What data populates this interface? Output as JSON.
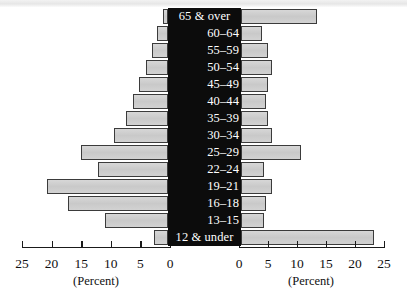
{
  "chart_data": {
    "type": "bar",
    "subtype": "population-pyramid",
    "title": "",
    "xlabel": "(Percent)",
    "ylabel": "",
    "categories": [
      "65 & over",
      "60–64",
      "55–59",
      "50–54",
      "45–49",
      "40–44",
      "35–39",
      "30–34",
      "25–29",
      "22–24",
      "19–21",
      "16–18",
      "13–15",
      "12 & under"
    ],
    "series": [
      {
        "name": "left",
        "side": "left",
        "values": [
          0.8,
          1.6,
          2.4,
          3.3,
          4.3,
          5.2,
          6.3,
          8.0,
          12.9,
          10.4,
          18.0,
          14.9,
          9.4,
          2.1
        ]
      },
      {
        "name": "right",
        "side": "right",
        "values": [
          11.4,
          3.2,
          4.0,
          4.7,
          4.1,
          3.8,
          4.0,
          4.7,
          9.1,
          3.5,
          4.6,
          3.8,
          3.4,
          20.1
        ]
      }
    ],
    "xlim": [
      0,
      25
    ],
    "left_ticks": [
      25,
      20,
      15,
      10,
      5,
      0
    ],
    "right_ticks": [
      0,
      5,
      10,
      15,
      20,
      25
    ],
    "grid": false,
    "legend": "none",
    "bar_fill_color": "#cecece",
    "bar_edge_color": "#3b3b3b",
    "center_panel_color": "#0c0c0c",
    "label_text_color": "#ffffff"
  },
  "axes": {
    "left": {
      "name": "left-axis",
      "title": "(Percent)",
      "ticks": [
        "25",
        "20",
        "15",
        "10",
        "5",
        "0"
      ]
    },
    "right": {
      "name": "right-axis",
      "title": "(Percent)",
      "ticks": [
        "0",
        "5",
        "10",
        "15",
        "20",
        "25"
      ]
    }
  }
}
